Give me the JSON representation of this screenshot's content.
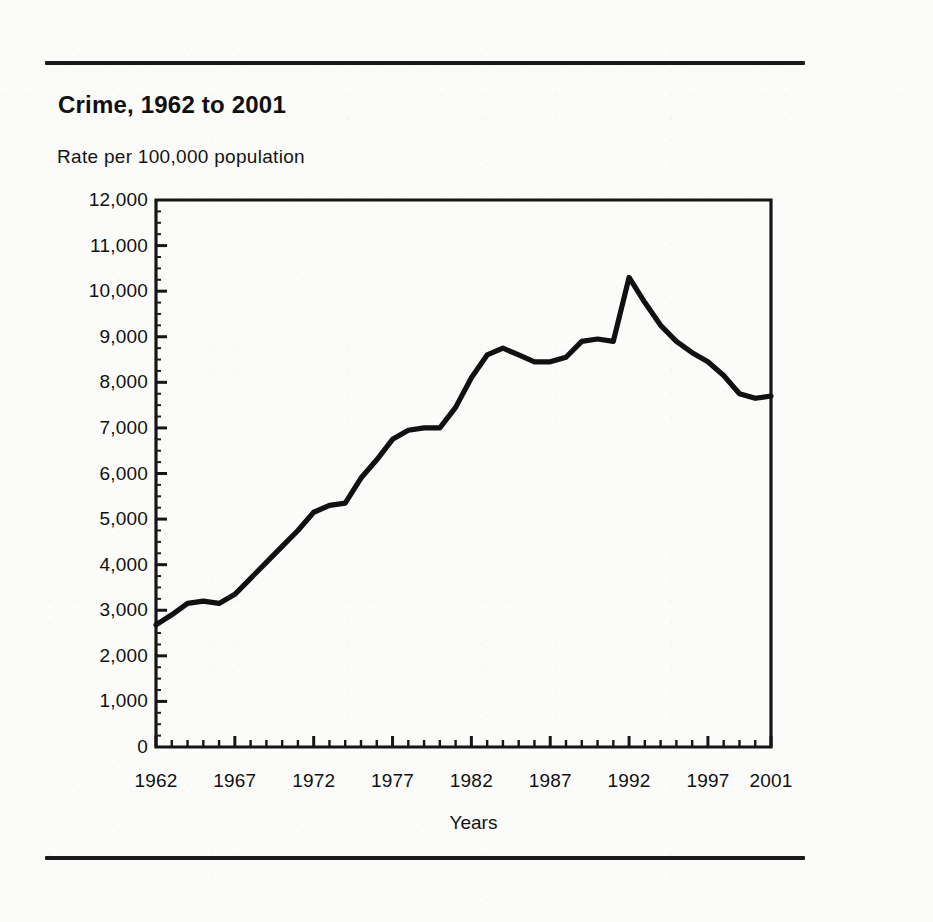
{
  "figure": {
    "title": "Crime, 1962 to 2001",
    "subtitle": "Rate per 100,000 population",
    "top_rule": "horizontal-rule",
    "bottom_rule": "horizontal-rule"
  },
  "chart_data": {
    "type": "line",
    "title": "Crime, 1962 to 2001",
    "subtitle": "Rate per 100,000 population",
    "xlabel": "Years",
    "ylabel": "Rate per 100,000 population",
    "xlim": [
      1962,
      2001
    ],
    "ylim": [
      0,
      12000
    ],
    "grid": false,
    "legend": "none",
    "y_ticks": [
      0,
      1000,
      2000,
      3000,
      4000,
      5000,
      6000,
      7000,
      8000,
      9000,
      10000,
      11000,
      12000
    ],
    "y_tick_labels": [
      "0",
      "1,000",
      "2,000",
      "3,000",
      "4,000",
      "5,000",
      "6,000",
      "7,000",
      "8,000",
      "9,000",
      "10,000",
      "11,000",
      "12,000"
    ],
    "x_tick_labels": [
      "1962",
      "1967",
      "1972",
      "1977",
      "1982",
      "1987",
      "1992",
      "1997",
      "2001"
    ],
    "x_tick_years": [
      1962,
      1967,
      1972,
      1977,
      1982,
      1987,
      1992,
      1997,
      2001
    ],
    "x_minor_tick_interval": 1,
    "series": [
      {
        "name": "Crime rate",
        "color": "#111111",
        "x": [
          1962,
          1963,
          1964,
          1965,
          1966,
          1967,
          1968,
          1969,
          1970,
          1971,
          1972,
          1973,
          1974,
          1975,
          1976,
          1977,
          1978,
          1979,
          1980,
          1981,
          1982,
          1983,
          1984,
          1985,
          1986,
          1987,
          1988,
          1989,
          1990,
          1991,
          1992,
          1993,
          1994,
          1995,
          1996,
          1997,
          1998,
          1999,
          2000,
          2001
        ],
        "values": [
          2680,
          2900,
          3150,
          3200,
          3150,
          3350,
          3700,
          4050,
          4400,
          4750,
          5150,
          5300,
          5350,
          5900,
          6300,
          6750,
          6950,
          7000,
          7000,
          7450,
          8100,
          8600,
          8750,
          8600,
          8450,
          8450,
          8550,
          8900,
          8950,
          8900,
          10300,
          9750,
          9250,
          8900,
          8650,
          8450,
          8150,
          7750,
          7650,
          7700
        ]
      }
    ]
  }
}
